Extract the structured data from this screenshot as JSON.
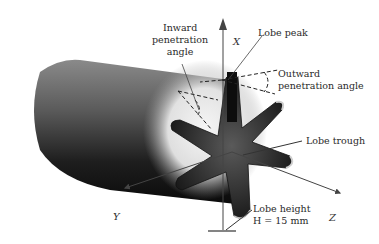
{
  "diagram": {
    "axes": {
      "x": "X",
      "y": "Y",
      "z": "Z"
    },
    "labels": {
      "inward_line1": "Inward",
      "inward_line2": "penetration",
      "inward_line3": "angle",
      "lobe_peak": "Lobe peak",
      "outward_line1": "Outward",
      "outward_line2": "penetration angle",
      "lobe_trough": "Lobe trough",
      "lobe_height_line1": "Lobe height",
      "lobe_height_line2": "H = 15 mm"
    },
    "lobe_count": 6,
    "lobe_height_mm": 15
  }
}
